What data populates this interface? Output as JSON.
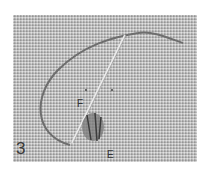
{
  "image": {
    "description": "Grayscale photograph of an embroidery stitch in progress on evenweave linen: a loop of thread with a needle passing diagonally through the fabric, with a small worked stitch cluster near the bottom.",
    "step_number": "3",
    "labels": {
      "point_f": "F",
      "point_e": "E"
    },
    "colors": {
      "background": "#ffffff",
      "fabric": "#b9b9b9",
      "thread": "#6e6e6e",
      "needle": "#e6e6e6",
      "label": "#333333"
    }
  }
}
